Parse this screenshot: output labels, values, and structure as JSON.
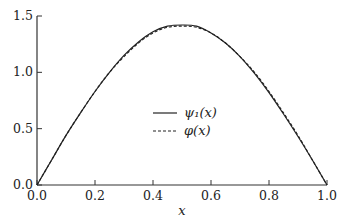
{
  "chart_data": {
    "type": "line",
    "title": "",
    "xlabel": "x",
    "ylabel": "",
    "xlim": [
      0.0,
      1.0
    ],
    "ylim": [
      0.0,
      1.5
    ],
    "xticks": [
      "0.0",
      "0.2",
      "0.4",
      "0.6",
      "0.8",
      "1.0"
    ],
    "yticks": [
      "0.0",
      "0.5",
      "1.0",
      "1.5"
    ],
    "grid": false,
    "legend_position": "center",
    "x": [
      0.0,
      0.05,
      0.1,
      0.15,
      0.2,
      0.25,
      0.3,
      0.35,
      0.4,
      0.45,
      0.5,
      0.55,
      0.6,
      0.65,
      0.7,
      0.75,
      0.8,
      0.85,
      0.9,
      0.95,
      1.0
    ],
    "series": [
      {
        "name": "ψ1(x)",
        "legend_label": "ψ₁(x)",
        "style": "solid",
        "values": [
          0.0,
          0.22,
          0.44,
          0.64,
          0.83,
          1.0,
          1.15,
          1.27,
          1.36,
          1.41,
          1.42,
          1.41,
          1.35,
          1.26,
          1.14,
          0.99,
          0.82,
          0.63,
          0.43,
          0.22,
          0.0
        ]
      },
      {
        "name": "φ(x)",
        "legend_label": "φ(x)",
        "style": "dashed",
        "values": [
          0.0,
          0.22,
          0.44,
          0.64,
          0.83,
          1.0,
          1.14,
          1.26,
          1.35,
          1.4,
          1.41,
          1.4,
          1.35,
          1.26,
          1.14,
          1.0,
          0.83,
          0.64,
          0.44,
          0.22,
          0.0
        ]
      }
    ]
  }
}
